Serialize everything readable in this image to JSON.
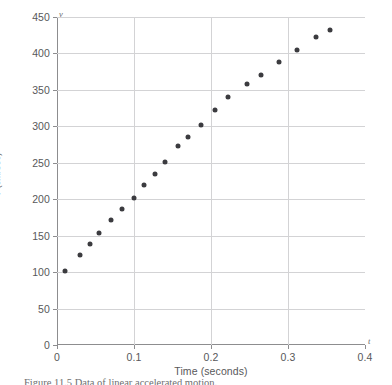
{
  "figure": {
    "caption": "Figure 11.5   Data of linear accelerated motion.",
    "y_axis_variable": "v",
    "x_axis_variable": "t"
  },
  "chart_data": {
    "type": "scatter",
    "title": "",
    "xlabel": "Time (seconds)",
    "ylabel": "v (cm/sec)",
    "xlim": [
      0,
      0.4
    ],
    "ylim": [
      0,
      450
    ],
    "xticks": [
      "0",
      "0.1",
      "0.2",
      "0.3",
      "0.4"
    ],
    "xtick_values": [
      0,
      0.1,
      0.2,
      0.3,
      0.4
    ],
    "yticks": [
      "0",
      "50",
      "100",
      "150",
      "200",
      "250",
      "300",
      "350",
      "400",
      "450"
    ],
    "ytick_values": [
      0,
      50,
      100,
      150,
      200,
      250,
      300,
      350,
      400,
      450
    ],
    "grid": true,
    "legend": false,
    "marker_color": "#3b3b3f",
    "points": [
      {
        "x": 0.01,
        "y": 102
      },
      {
        "x": 0.03,
        "y": 123
      },
      {
        "x": 0.043,
        "y": 139
      },
      {
        "x": 0.055,
        "y": 153
      },
      {
        "x": 0.07,
        "y": 172
      },
      {
        "x": 0.085,
        "y": 186
      },
      {
        "x": 0.1,
        "y": 202
      },
      {
        "x": 0.113,
        "y": 219
      },
      {
        "x": 0.127,
        "y": 235
      },
      {
        "x": 0.14,
        "y": 251
      },
      {
        "x": 0.157,
        "y": 273
      },
      {
        "x": 0.17,
        "y": 286
      },
      {
        "x": 0.187,
        "y": 302
      },
      {
        "x": 0.205,
        "y": 322
      },
      {
        "x": 0.222,
        "y": 340
      },
      {
        "x": 0.247,
        "y": 358
      },
      {
        "x": 0.265,
        "y": 371
      },
      {
        "x": 0.288,
        "y": 388
      },
      {
        "x": 0.312,
        "y": 405
      },
      {
        "x": 0.337,
        "y": 423
      },
      {
        "x": 0.355,
        "y": 432
      }
    ]
  }
}
